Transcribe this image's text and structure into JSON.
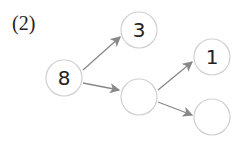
{
  "problem_label": "(2)",
  "nodes": [
    {
      "id": "root",
      "value": "8",
      "cx": 64,
      "cy": 78
    },
    {
      "id": "top",
      "value": "3",
      "cx": 139,
      "cy": 30
    },
    {
      "id": "middle",
      "value": "",
      "cx": 139,
      "cy": 97
    },
    {
      "id": "right-top",
      "value": "1",
      "cx": 212,
      "cy": 57
    },
    {
      "id": "right-bottom",
      "value": "",
      "cx": 212,
      "cy": 117
    }
  ],
  "colors": {
    "circle_stroke": "#d0d0d0",
    "arrow": "#888888",
    "text": "#222222"
  }
}
